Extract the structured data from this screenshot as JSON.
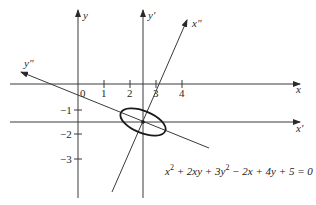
{
  "diagram": {
    "axes": {
      "x": "x",
      "y": "y",
      "x_prime": "x′",
      "y_prime": "y′",
      "x_double_prime": "x″",
      "y_double_prime": "y″"
    },
    "x_ticks": [
      "0",
      "1",
      "2",
      "3",
      "4"
    ],
    "y_ticks": [
      "−1",
      "−2",
      "−3"
    ],
    "equation": "x² + 2xy + 3y² − 2x + 4y + 5 = 0",
    "equation_parts": {
      "t1": "x",
      "s1": "2",
      "t2": " + 2xy + 3y",
      "s2": "2",
      "t3": " − 2x + 4y + 5 = 0"
    }
  }
}
